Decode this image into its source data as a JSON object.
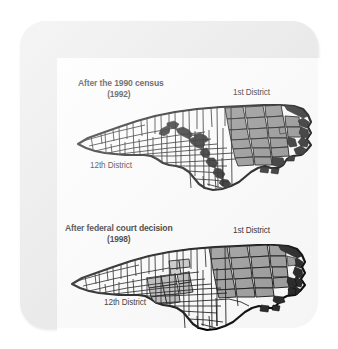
{
  "figure": {
    "kind": "two-panel-map-figure",
    "frame_color": "#e9e9e9",
    "panel_color": "#ffffff"
  },
  "maps": [
    {
      "id": "map-1992",
      "title": "After the 1990 census",
      "year": "(1992)",
      "labels": {
        "first_district": "1st District",
        "twelfth_district": "12th District"
      },
      "shading": {
        "first_district_fill": "#8c8c8c",
        "twelfth_district_fill": "#1a1a1a",
        "other_counties_fill": "#ffffff",
        "outline": "#000000"
      }
    },
    {
      "id": "map-1998",
      "title": "After federal court decision",
      "year": "(1998)",
      "labels": {
        "first_district": "1st District",
        "twelfth_district": "12th District"
      },
      "shading": {
        "first_district_fill": "#9a9a9a",
        "twelfth_district_fill": "#b5b5b5",
        "other_counties_fill": "#ffffff",
        "outline": "#000000"
      }
    }
  ]
}
